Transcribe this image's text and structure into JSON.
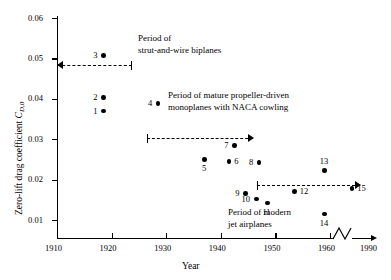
{
  "chart_data": {
    "type": "scatter",
    "title": "",
    "xlabel": "Year",
    "ylabel": "Zero-lift drag coefficient CD,0",
    "ylabel_main": "Zero-lift drag coefficient ",
    "ylabel_symbol": "C",
    "ylabel_subscript": "D,0",
    "xlim": [
      1910,
      1990
    ],
    "ylim": [
      0,
      0.06
    ],
    "grid": false,
    "legend": "none",
    "axis_break": {
      "present": true,
      "between": [
        1960,
        1990
      ],
      "label": "zigzag"
    },
    "xticks": [
      1910,
      1920,
      1930,
      1940,
      1950,
      1960,
      1990
    ],
    "xticklabels": [
      "1910",
      "1920",
      "1930",
      "1940",
      "1950",
      "1960",
      "1990"
    ],
    "yticks": [
      0.01,
      0.02,
      0.03,
      0.04,
      0.05,
      0.06
    ],
    "yticklabels": [
      "0.01",
      "0.02",
      "0.03",
      "0.04",
      "0.05",
      "0.06"
    ],
    "points": [
      {
        "id": "1",
        "year": 1918.5,
        "cd0": 0.037,
        "label": "1",
        "label_side": "left"
      },
      {
        "id": "2",
        "year": 1918.5,
        "cd0": 0.0403,
        "label": "2",
        "label_side": "left"
      },
      {
        "id": "3",
        "year": 1918.5,
        "cd0": 0.0507,
        "label": "3",
        "label_side": "left"
      },
      {
        "id": "4",
        "year": 1928.5,
        "cd0": 0.0388,
        "label": "4",
        "label_side": "left"
      },
      {
        "id": "5",
        "year": 1937.0,
        "cd0": 0.025,
        "label": "5",
        "label_side": "below"
      },
      {
        "id": "6",
        "year": 1941.5,
        "cd0": 0.0245,
        "label": "6",
        "label_side": "right"
      },
      {
        "id": "7",
        "year": 1942.5,
        "cd0": 0.0285,
        "label": "7",
        "label_side": "left"
      },
      {
        "id": "8",
        "year": 1947.0,
        "cd0": 0.0243,
        "label": "8",
        "label_side": "left"
      },
      {
        "id": "9",
        "year": 1944.5,
        "cd0": 0.0165,
        "label": "9",
        "label_side": "left"
      },
      {
        "id": "10",
        "year": 1946.5,
        "cd0": 0.0152,
        "label": "10",
        "label_side": "left"
      },
      {
        "id": "11",
        "year": 1948.5,
        "cd0": 0.0142,
        "label": "11",
        "label_side": "below"
      },
      {
        "id": "12",
        "year": 1953.5,
        "cd0": 0.017,
        "label": "12",
        "label_side": "right"
      },
      {
        "id": "13",
        "year": 1959.0,
        "cd0": 0.0222,
        "label": "13",
        "label_side": "above"
      },
      {
        "id": "14",
        "year": 1959.0,
        "cd0": 0.0115,
        "label": "14",
        "label_side": "below"
      },
      {
        "id": "15",
        "year": 1964.0,
        "cd0": 0.0178,
        "label": "15",
        "label_side": "right"
      }
    ],
    "annotations": [
      {
        "id": "period-strut-wire",
        "line1": "Period of",
        "line2": "strut-and-wire biplanes"
      },
      {
        "id": "period-monoplanes",
        "line1": "Period of mature propeller-driven",
        "line2": "monoplanes with NACA cowling"
      },
      {
        "id": "period-jet",
        "line1": "Period of modern",
        "line2": "jet airplanes"
      }
    ],
    "period_bars": [
      {
        "id": "bar-strut-wire",
        "from_year": 1910,
        "to_year": 1923.7,
        "cd0": 0.0445,
        "left_end": "arrow",
        "right_end": "cap"
      },
      {
        "id": "bar-monoplanes",
        "from_year": 1926.5,
        "to_year": 1945.9,
        "cd0": 0.0265,
        "left_end": "cap",
        "right_end": "arrow"
      },
      {
        "id": "bar-jet",
        "from_year": 1946.6,
        "to_year": 1965.5,
        "cd0": 0.0147,
        "left_end": "cap",
        "right_end": "arrow"
      }
    ]
  }
}
